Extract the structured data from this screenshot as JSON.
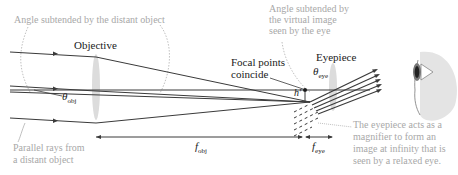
{
  "labels": {
    "angle_distant_object": "Angle subtended by the distant object",
    "objective": "Objective",
    "angle_virtual_image": [
      "Angle subtended by",
      "the virtual image",
      "seen by the eye"
    ],
    "focal_points": [
      "Focal points",
      "coincide"
    ],
    "eyepiece": "Eyepiece",
    "theta_eye": "θ",
    "theta_eye_sub": "eye",
    "theta_obj": "θ",
    "theta_obj_sub": "obj",
    "h_prime": "h′",
    "parallel_rays": [
      "Parallel rays from",
      "a distant object"
    ],
    "f_obj": "f",
    "f_obj_sub": "obj",
    "f_eye": "f",
    "f_eye_sub": "eye",
    "eyepiece_note": [
      "The eyepiece acts as a",
      "magnifier to form an",
      "image at infinity that is",
      "seen by a relaxed eye."
    ]
  },
  "colors": {
    "ray": "#3a3a3a",
    "lens": "#d6d6d6",
    "annotation": "#a8a8a8",
    "eye_shadow": "#e2e2e2"
  }
}
